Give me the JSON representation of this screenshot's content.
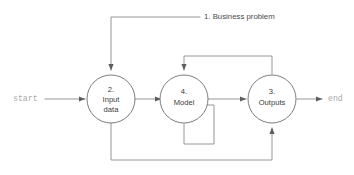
{
  "diagram": {
    "type": "flowchart",
    "title": "",
    "terminals": {
      "start": "start",
      "end": "end"
    },
    "nodes": [
      {
        "id": "input-data",
        "number": "2.",
        "line1": "Input",
        "line2": "data"
      },
      {
        "id": "model",
        "number": "4.",
        "line1": "Model",
        "line2": ""
      },
      {
        "id": "outputs",
        "number": "3.",
        "line1": "Outputs",
        "line2": ""
      }
    ],
    "edge_labels": [
      {
        "id": "business-problem",
        "text": "1. Business problem"
      }
    ],
    "colors": {
      "line": "#8a8a8a",
      "node_stroke": "#6e6e6e",
      "node_fill": "#ffffff",
      "node_text": "#3b3b3b",
      "label_text": "#4a4a4a",
      "terminal_text": "#a9a9a9",
      "background": "#ffffff"
    }
  }
}
